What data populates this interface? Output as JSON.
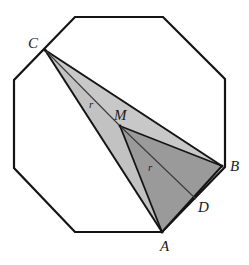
{
  "figure": {
    "kind": "geometry-diagram",
    "canvas": {
      "width": 249,
      "height": 265
    },
    "colors": {
      "background": "#ffffff",
      "outline": "#141414",
      "light_fill": "#c8c8c8",
      "mid_fill": "#b4b4b4",
      "dark_fill": "#9a9a9a",
      "label": "#1a1a1a"
    },
    "octagon": {
      "name": "regular-octagon",
      "stroke_width": 2.2,
      "vertices": [
        {
          "name": "oct-top-left",
          "x": 75,
          "y": 17
        },
        {
          "name": "oct-top-right",
          "x": 163,
          "y": 17
        },
        {
          "name": "oct-right-top",
          "x": 225,
          "y": 79
        },
        {
          "name": "oct-right-bottom",
          "x": 225,
          "y": 167
        },
        {
          "name": "oct-bottom-right",
          "x": 162,
          "y": 232
        },
        {
          "name": "oct-bottom-left",
          "x": 75,
          "y": 232
        },
        {
          "name": "oct-left-bottom",
          "x": 14,
          "y": 168
        },
        {
          "name": "oct-left-top",
          "x": 14,
          "y": 80
        }
      ]
    },
    "points": [
      {
        "id": "C",
        "label": "C",
        "x": 45,
        "y": 50,
        "label_x": 28,
        "label_y": 36
      },
      {
        "id": "M",
        "label": "M",
        "x": 120,
        "y": 126,
        "label_x": 114,
        "label_y": 108
      },
      {
        "id": "B",
        "label": "B",
        "x": 222,
        "y": 166,
        "label_x": 230,
        "label_y": 167
      },
      {
        "id": "D",
        "label": "D",
        "x": 196,
        "y": 199,
        "label_x": 198,
        "label_y": 203
      },
      {
        "id": "A",
        "label": "A",
        "x": 162,
        "y": 232,
        "label_x": 162,
        "label_y": 238
      }
    ],
    "segment_labels": [
      {
        "id": "r-CM",
        "text": "r",
        "x": 89,
        "y": 103
      },
      {
        "id": "r-MA",
        "text": "r",
        "x": 148,
        "y": 166
      }
    ],
    "shaded_regions": [
      {
        "id": "triangle-C-M-B",
        "fill": "#c8c8c8",
        "points": "45,50 120,126 222,166"
      },
      {
        "id": "triangle-C-M-A",
        "fill": "#c2c2c2",
        "points": "45,50 120,126 162,232"
      },
      {
        "id": "triangle-A-M-B",
        "fill": "#9a9a9a",
        "points": "162,232 120,126 222,166"
      }
    ],
    "segments": [
      {
        "id": "segment-CB",
        "from": "C",
        "to": "B"
      },
      {
        "id": "segment-CA",
        "from": "C",
        "to": "A"
      },
      {
        "id": "segment-CM",
        "from": "C",
        "to": "M"
      },
      {
        "id": "segment-MA",
        "from": "M",
        "to": "A"
      },
      {
        "id": "segment-MB",
        "from": "M",
        "to": "B"
      },
      {
        "id": "segment-MD",
        "from": "M",
        "to": "D"
      },
      {
        "id": "segment-AB",
        "from": "A",
        "to": "B"
      }
    ]
  }
}
